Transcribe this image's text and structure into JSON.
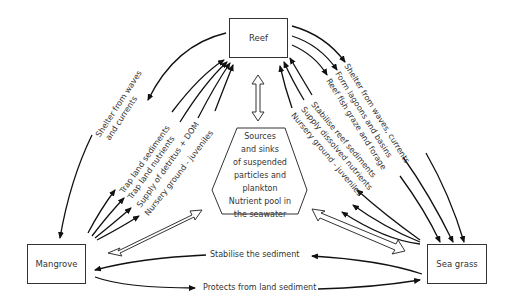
{
  "nodes": {
    "reef": "Reef",
    "mangrove": "Mangrove",
    "seagrass": "Sea grass",
    "center": [
      "Sources",
      "and sinks",
      "of suspended",
      "particles and",
      "plankton",
      "Nutrient pool in",
      "the seawater"
    ]
  },
  "links": {
    "reef_to_mangrove": [
      "Shelter from waves",
      "and currents"
    ],
    "mangrove_to_reef": [
      "Trap land sediments",
      "Trap land nutrients",
      "Supply of detritus + DOM",
      "Nursery ground - juveniles"
    ],
    "reef_to_seagrass": [
      "Shelter from waves, currents",
      "Form lagoons and basins",
      "Reef fish graze and forage"
    ],
    "seagrass_to_reef": [
      "Stabilise reef sediments",
      "Supply dissolved nutrients",
      "Nursery ground - juveniles"
    ],
    "seagrass_to_mangrove": "Stabilise the sediment",
    "mangrove_to_seagrass": "Protects from land sediment"
  }
}
